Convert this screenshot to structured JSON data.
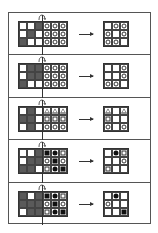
{
  "figure": {
    "panels": [
      {
        "mask": [
          [
            0,
            0,
            1
          ],
          [
            0,
            1,
            0
          ],
          [
            1,
            0,
            0
          ]
        ],
        "symbols": [
          [
            "circle",
            "circle",
            "circle"
          ],
          [
            "circle",
            "circle",
            "circle"
          ],
          [
            "circle",
            "circle",
            "circle"
          ]
        ],
        "result": [
          [
            "",
            "circle",
            "circle"
          ],
          [
            "circle",
            "",
            "circle"
          ],
          [
            "circle",
            "circle",
            ""
          ]
        ]
      },
      {
        "mask": [
          [
            0,
            1,
            1
          ],
          [
            0,
            1,
            1
          ],
          [
            1,
            0,
            0
          ]
        ],
        "symbols": [
          [
            "circle",
            "circle",
            "circle"
          ],
          [
            "circle",
            "circle",
            "circle"
          ],
          [
            "circle",
            "circle",
            "circle"
          ]
        ],
        "result": [
          [
            "",
            "",
            "circle"
          ],
          [
            "",
            "",
            "circle"
          ],
          [
            "circle",
            "circle",
            ""
          ]
        ]
      },
      {
        "mask": [
          [
            0,
            1,
            0
          ],
          [
            1,
            1,
            0
          ],
          [
            0,
            1,
            0
          ]
        ],
        "symbols": [
          [
            "triangle",
            "triangle",
            "triangle"
          ],
          [
            "square",
            "square",
            "square"
          ],
          [
            "circle",
            "circle",
            "circle"
          ]
        ],
        "result": [
          [
            "triangle",
            "",
            "triangle"
          ],
          [
            "square",
            "",
            ""
          ],
          [
            "circle",
            "",
            "circle"
          ]
        ]
      },
      {
        "mask": [
          [
            0,
            0,
            1
          ],
          [
            0,
            1,
            1
          ],
          [
            1,
            1,
            0
          ]
        ],
        "symbols": [
          [
            "fsquare",
            "fcircle",
            "square"
          ],
          [
            "circle",
            "fsquare",
            "circle"
          ],
          [
            "square",
            "fcircle",
            "fsquare"
          ]
        ],
        "result": [
          [
            "",
            "fcircle",
            "square"
          ],
          [
            "",
            "",
            "circle"
          ],
          [
            "square",
            "",
            ""
          ]
        ]
      },
      {
        "mask": [
          [
            1,
            0,
            1
          ],
          [
            1,
            1,
            1
          ],
          [
            0,
            1,
            1
          ]
        ],
        "symbols": [
          [
            "fsquare",
            "fcircle",
            "square"
          ],
          [
            "circle",
            "fsquare",
            "circle"
          ],
          [
            "square",
            "fcircle",
            "fsquare"
          ]
        ],
        "result": [
          [
            "",
            "fcircle",
            ""
          ],
          [
            "circle",
            "",
            ""
          ],
          [
            "",
            "",
            "fsquare"
          ]
        ]
      }
    ]
  },
  "icons": {
    "fold": "curved-fold-arrow-icon",
    "transform": "right-arrow-icon"
  },
  "colors": {
    "mask_dark": "#5a5a5a",
    "line": "#333333",
    "background": "#ffffff"
  }
}
